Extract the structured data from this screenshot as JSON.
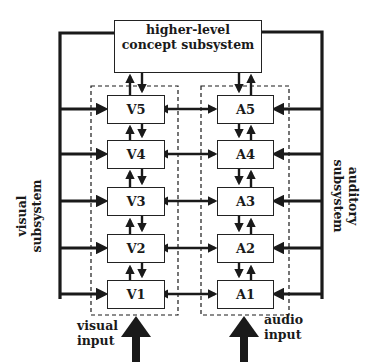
{
  "diagram": {
    "top_box": {
      "line1": "higher-level",
      "line2": "concept subsystem"
    },
    "visual_modules": [
      "V5",
      "V4",
      "V3",
      "V2",
      "V1"
    ],
    "audio_modules": [
      "A5",
      "A4",
      "A3",
      "A2",
      "A1"
    ],
    "side_labels": {
      "left": {
        "line1": "visual",
        "line2": "subsystem"
      },
      "right": {
        "line1": "auditory",
        "line2": "subsystem"
      }
    },
    "input_labels": {
      "visual": {
        "line1": "visual",
        "line2": "input"
      },
      "audio": {
        "line1": "audio",
        "line2": "input"
      }
    },
    "colors": {
      "line": "#1a1a1a",
      "background": "#ffffff"
    }
  }
}
